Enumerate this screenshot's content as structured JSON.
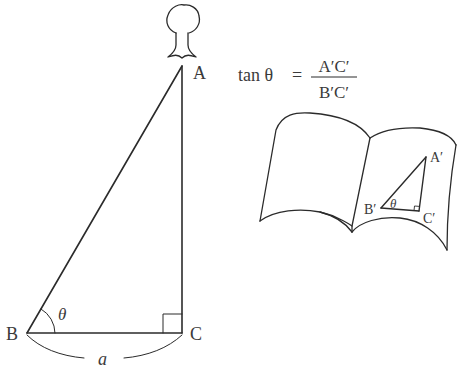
{
  "diagram": {
    "type": "trigonometry-illustration",
    "main_triangle": {
      "vertices": {
        "A": {
          "label": "A",
          "x": 182,
          "y": 66
        },
        "B": {
          "label": "B",
          "x": 27,
          "y": 333
        },
        "C": {
          "label": "C",
          "x": 182,
          "y": 333
        }
      },
      "angle_label": "θ",
      "base_label": "a",
      "right_angle_at": "C"
    },
    "tree": {
      "description": "tree atop vertex A"
    },
    "formula": {
      "lhs": "tan θ",
      "equals": "=",
      "numerator": "A′C′",
      "denominator": "B′C′"
    },
    "book": {
      "description": "open book showing a similar triangle",
      "small_triangle": {
        "vertices": {
          "A_prime": {
            "label": "A′",
            "x": 426,
            "y": 157
          },
          "B_prime": {
            "label": "B′",
            "x": 381,
            "y": 208
          },
          "C_prime": {
            "label": "C′",
            "x": 419,
            "y": 211
          }
        },
        "angle_label": "θ",
        "right_angle_at": "C′"
      }
    },
    "colors": {
      "stroke": "#2b2b2b",
      "text": "#3a3a3a",
      "background": "#ffffff"
    }
  }
}
